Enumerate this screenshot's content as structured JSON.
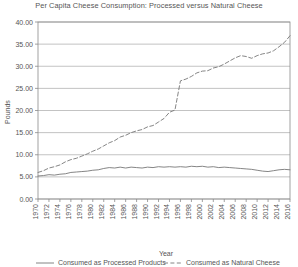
{
  "chart_data": {
    "type": "line",
    "title": "Per Capita Cheese Consumption: Processed versus Natural Cheese",
    "xlabel": "Year",
    "ylabel": "Pounds",
    "ylim": [
      0,
      40
    ],
    "ytick_step": 5,
    "ytick_labels": [
      "0.00",
      "5.00",
      "10.00",
      "15.00",
      "20.00",
      "25.00",
      "30.00",
      "35.00",
      "40.00"
    ],
    "ytick_values": [
      0,
      5,
      10,
      15,
      20,
      25,
      30,
      35,
      40
    ],
    "xlim": [
      1970,
      2016
    ],
    "xtick_labels": [
      "1970",
      "1972",
      "1974",
      "1976",
      "1978",
      "1980",
      "1982",
      "1984",
      "1986",
      "1988",
      "1990",
      "1992",
      "1994",
      "1996",
      "1998",
      "2000",
      "2002",
      "2004",
      "2006",
      "2008",
      "2010",
      "2012",
      "2014",
      "2016"
    ],
    "x": [
      1970,
      1971,
      1972,
      1973,
      1974,
      1975,
      1976,
      1977,
      1978,
      1979,
      1980,
      1981,
      1982,
      1983,
      1984,
      1985,
      1986,
      1987,
      1988,
      1989,
      1990,
      1991,
      1992,
      1993,
      1994,
      1995,
      1996,
      1997,
      1998,
      1999,
      2000,
      2001,
      2002,
      2003,
      2004,
      2005,
      2006,
      2007,
      2008,
      2009,
      2010,
      2011,
      2012,
      2013,
      2014,
      2015,
      2016
    ],
    "grid": true,
    "legend_position": "bottom",
    "series": [
      {
        "name": "Consumed as Processed Products",
        "style": "solid",
        "color": "#777777",
        "values": [
          5.2,
          5.3,
          5.5,
          5.4,
          5.6,
          5.7,
          6.0,
          6.1,
          6.2,
          6.3,
          6.5,
          6.6,
          6.9,
          7.1,
          7.0,
          7.2,
          7.0,
          7.2,
          7.1,
          7.0,
          7.2,
          7.1,
          7.3,
          7.2,
          7.3,
          7.2,
          7.3,
          7.2,
          7.4,
          7.3,
          7.4,
          7.2,
          7.3,
          7.1,
          7.2,
          7.1,
          7.0,
          6.9,
          6.8,
          6.7,
          6.5,
          6.3,
          6.2,
          6.4,
          6.6,
          6.7,
          6.6
        ]
      },
      {
        "name": "Consumed as Natural Cheese",
        "style": "dashed",
        "color": "#777777",
        "values": [
          6.0,
          6.4,
          7.0,
          7.3,
          7.7,
          8.4,
          8.9,
          9.2,
          9.7,
          10.2,
          10.8,
          11.3,
          12.0,
          12.7,
          13.2,
          14.0,
          14.4,
          15.0,
          15.4,
          15.7,
          16.3,
          16.6,
          17.4,
          18.2,
          19.6,
          20.1,
          26.7,
          27.1,
          27.7,
          28.5,
          28.9,
          29.0,
          29.6,
          29.9,
          30.5,
          31.2,
          31.9,
          32.4,
          32.2,
          31.8,
          32.4,
          32.8,
          33.0,
          33.5,
          34.4,
          35.4,
          36.9
        ]
      }
    ]
  }
}
